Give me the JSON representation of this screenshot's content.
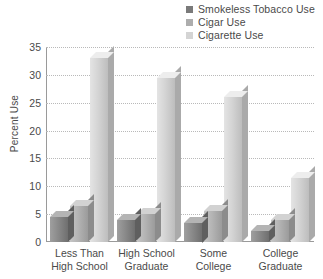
{
  "chart_data": {
    "type": "bar",
    "title": "",
    "xlabel": "",
    "ylabel": "Percent Use",
    "ylim": [
      0,
      35
    ],
    "yticks": [
      0,
      5,
      10,
      15,
      20,
      25,
      30,
      35
    ],
    "grid": true,
    "legend_position": "top-right",
    "categories": [
      "Less Than\nHigh School",
      "High School\nGraduate",
      "Some\nCollege",
      "College\nGraduate"
    ],
    "series": [
      {
        "name": "Smokeless Tobacco Use",
        "color": "#7a7a7a",
        "values": [
          4.5,
          4,
          3.5,
          2
        ]
      },
      {
        "name": "Cigar Use",
        "color": "#adadad",
        "values": [
          6.5,
          5,
          5.5,
          4
        ]
      },
      {
        "name": "Cigarette Use",
        "color": "#d4d4d4",
        "values": [
          33,
          29.5,
          26,
          11.5
        ]
      }
    ]
  },
  "axis": {
    "y_title": "Percent Use",
    "tick_labels": [
      "35",
      "30",
      "25",
      "20",
      "15",
      "10",
      "5",
      "0"
    ]
  },
  "legend": {
    "items": [
      {
        "label": "Smokeless Tobacco Use",
        "color": "#7a7a7a"
      },
      {
        "label": "Cigar Use",
        "color": "#adadad"
      },
      {
        "label": "Cigarette Use",
        "color": "#d4d4d4"
      }
    ]
  }
}
